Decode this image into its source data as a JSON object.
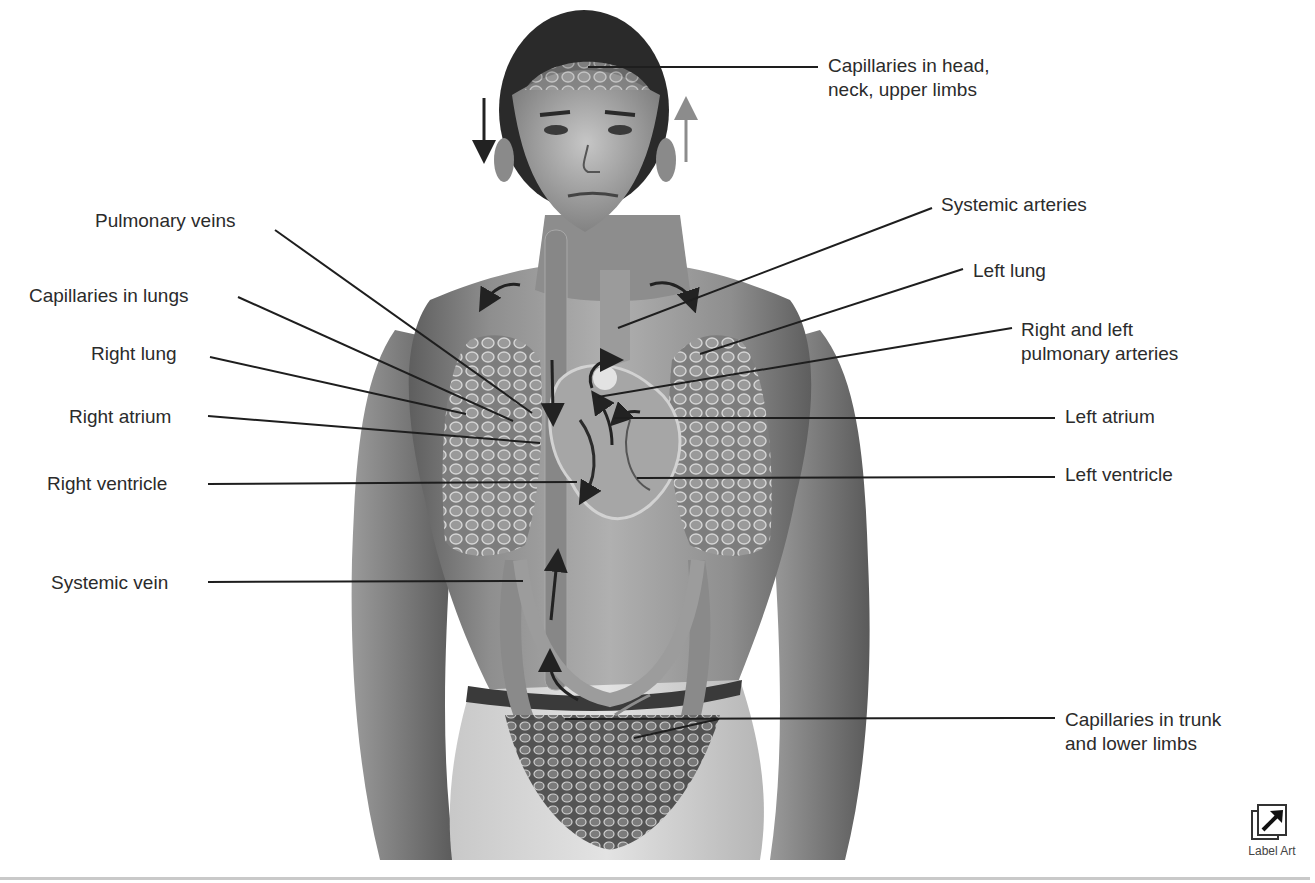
{
  "figure": {
    "labels_left": [
      {
        "id": "pulmonary-veins",
        "text": "Pulmonary veins"
      },
      {
        "id": "capillaries-lungs",
        "text": "Capillaries in lungs"
      },
      {
        "id": "right-lung",
        "text": "Right lung"
      },
      {
        "id": "right-atrium",
        "text": "Right atrium"
      },
      {
        "id": "right-ventricle",
        "text": "Right ventricle"
      },
      {
        "id": "systemic-vein",
        "text": "Systemic vein"
      }
    ],
    "labels_right": [
      {
        "id": "capillaries-head",
        "line1": "Capillaries in head,",
        "line2": "neck, upper limbs"
      },
      {
        "id": "systemic-arteries",
        "text": "Systemic arteries"
      },
      {
        "id": "left-lung",
        "text": "Left lung"
      },
      {
        "id": "pulmonary-arteries",
        "line1": "Right and left",
        "line2": "pulmonary arteries"
      },
      {
        "id": "left-atrium",
        "text": "Left atrium"
      },
      {
        "id": "left-ventricle",
        "text": "Left ventricle"
      },
      {
        "id": "capillaries-trunk",
        "line1": "Capillaries in trunk",
        "line2": "and lower limbs"
      }
    ],
    "colors": {
      "label_text": "#2b2b2b",
      "leader_line": "#1e1e1e",
      "skin_dark": "#6f6f6f",
      "skin_light": "#bdbdbd",
      "vessel": "#8a8a8a",
      "arrow_dark": "#222222",
      "arrow_light": "#8c8c8c"
    }
  },
  "label_art_button": {
    "label": "Label Art",
    "icon": "arrow-up-right-in-box-icon"
  }
}
